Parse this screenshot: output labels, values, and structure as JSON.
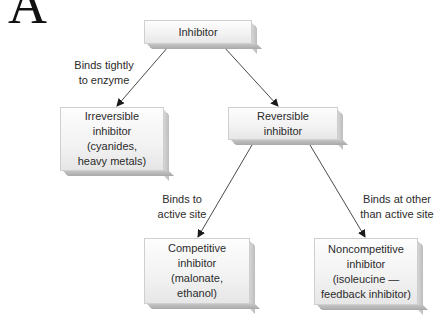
{
  "panel_letter": "A",
  "nodes": {
    "root": {
      "text": "Inhibitor"
    },
    "irreversible": {
      "text": "Irreversible\ninhibitor\n(cyanides,\nheavy metals)"
    },
    "reversible": {
      "text": "Reversible\ninhibitor"
    },
    "competitive": {
      "text": "Competitive\ninhibitor\n(malonate,\nethanol)"
    },
    "noncompetitive": {
      "text": "Noncompetitive\ninhibitor\n(isoleucine —\nfeedback inhibitor)"
    }
  },
  "edges": {
    "root_to_irreversible": {
      "label": "Binds tightly\nto enzyme"
    },
    "root_to_reversible": {
      "label": ""
    },
    "reversible_to_competitive": {
      "label": "Binds to\nactive site"
    },
    "reversible_to_noncompetitive": {
      "label": "Binds at other\nthan active site"
    }
  },
  "colors": {
    "box_fill": "#f2f2f2",
    "box_shadow": "#b8b8b8",
    "arrow": "#4a4a4a",
    "text": "#2b2b2b"
  }
}
